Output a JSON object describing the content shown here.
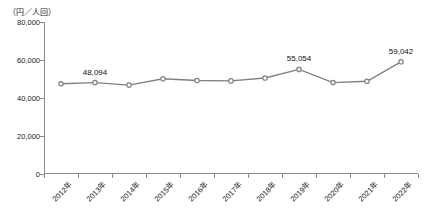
{
  "chart_data": {
    "type": "line",
    "title": "",
    "unit_label": "（円／人回）",
    "xlabel": "",
    "ylabel": "",
    "categories": [
      "2012年",
      "2013年",
      "2014年",
      "2015年",
      "2016年",
      "2017年",
      "2018年",
      "2019年",
      "2020年",
      "2021年",
      "2022年"
    ],
    "values": [
      47500,
      48094,
      46800,
      50100,
      49200,
      49000,
      50500,
      55054,
      48100,
      48800,
      59042
    ],
    "series": [
      {
        "name": "",
        "values": [
          47500,
          48094,
          46800,
          50100,
          49200,
          49000,
          50500,
          55054,
          48100,
          48800,
          59042
        ],
        "color": "#808080",
        "marker": "circle"
      }
    ],
    "point_labels": [
      {
        "index": 1,
        "text": "48,094"
      },
      {
        "index": 7,
        "text": "55,054"
      },
      {
        "index": 10,
        "text": "59,042"
      }
    ],
    "ylim": [
      0,
      80000
    ],
    "yticks": [
      0,
      20000,
      40000,
      60000,
      80000
    ],
    "ytick_labels": [
      "0",
      "20,000",
      "40,000",
      "60,000",
      "80,000"
    ],
    "grid": false,
    "legend": "none"
  }
}
